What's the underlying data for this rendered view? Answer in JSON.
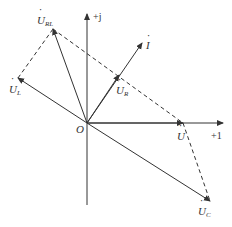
{
  "diagram": {
    "type": "phasor-diagram",
    "origin_label": "O",
    "axes": {
      "real": {
        "label": "+1"
      },
      "imag": {
        "label": "+j"
      }
    },
    "phasors": [
      {
        "id": "U_RL",
        "symbol": "U",
        "subscript": "RL",
        "kind": "solid"
      },
      {
        "id": "U_L",
        "symbol": "U",
        "subscript": "L",
        "kind": "solid"
      },
      {
        "id": "I",
        "symbol": "I",
        "subscript": "",
        "kind": "solid"
      },
      {
        "id": "U_R",
        "symbol": "U",
        "subscript": "R",
        "kind": "solid"
      },
      {
        "id": "U",
        "symbol": "U",
        "subscript": "",
        "kind": "solid"
      },
      {
        "id": "U_C",
        "symbol": "U",
        "subscript": "C",
        "kind": "solid"
      }
    ],
    "dashed_connections": [
      [
        "U_L",
        "U_RL"
      ],
      [
        "U_RL",
        "U"
      ],
      [
        "U",
        "U_C"
      ]
    ],
    "colors": {
      "line": "#333333",
      "background": "#ffffff"
    }
  }
}
